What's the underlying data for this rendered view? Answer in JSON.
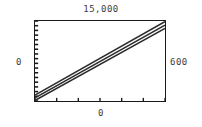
{
  "figure": {
    "title": "15,000",
    "y_left_label": "0",
    "x_right_label": "600",
    "x_bottom_label": "0",
    "frame_color": "#1a1a1a",
    "line_color": "#2b2b2b",
    "background": "#ffffff"
  },
  "chart_data": {
    "type": "line",
    "title": "15,000",
    "xlabel": "",
    "ylabel": "",
    "xlim": [
      0,
      600
    ],
    "ylim": [
      0,
      15000
    ],
    "grid": false,
    "legend": "none",
    "x_tick_labels": [
      "0",
      "600"
    ],
    "y_tick_labels": [
      "0",
      "15,000"
    ],
    "x_major_ticks": [
      0,
      100,
      200,
      300,
      400,
      500,
      600
    ],
    "y_minor_tick_count": 17,
    "x": [
      0,
      600
    ],
    "series": [
      {
        "name": "upper",
        "values": [
          1100,
          14900
        ]
      },
      {
        "name": "center",
        "values": [
          600,
          14200
        ]
      },
      {
        "name": "lower",
        "values": [
          100,
          13600
        ]
      }
    ]
  }
}
